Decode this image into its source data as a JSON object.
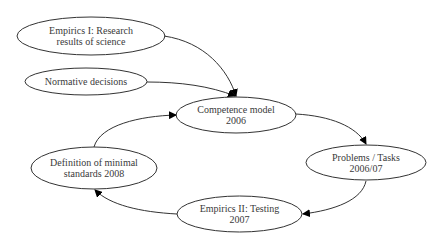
{
  "diagram": {
    "type": "cycle-flowchart",
    "colors": {
      "background": "#ffffff",
      "stroke": "#333333",
      "text": "#3a3a3a",
      "arrowhead": "#000000"
    },
    "nodes": [
      {
        "id": "empirics1",
        "line1": "Empirics I: Research",
        "line2": "results of science"
      },
      {
        "id": "normative",
        "line1": "Normative decisions",
        "line2": ""
      },
      {
        "id": "competence",
        "line1": "Competence model",
        "line2": "2006"
      },
      {
        "id": "problems",
        "line1": "Problems / Tasks",
        "line2": "2006/07"
      },
      {
        "id": "empirics2",
        "line1": "Empirics II: Testing",
        "line2": "2007"
      },
      {
        "id": "definition",
        "line1": "Definition of minimal",
        "line2": "standards 2008"
      }
    ],
    "edges": [
      {
        "from": "Empirics I: Research results of science",
        "to": "Competence model 2006"
      },
      {
        "from": "Normative decisions",
        "to": "Competence model 2006"
      },
      {
        "from": "Competence model 2006",
        "to": "Problems / Tasks 2006/07"
      },
      {
        "from": "Problems / Tasks 2006/07",
        "to": "Empirics II: Testing 2007"
      },
      {
        "from": "Empirics II: Testing 2007",
        "to": "Definition of minimal standards 2008"
      },
      {
        "from": "Definition of minimal standards 2008",
        "to": "Competence model 2006"
      }
    ]
  }
}
